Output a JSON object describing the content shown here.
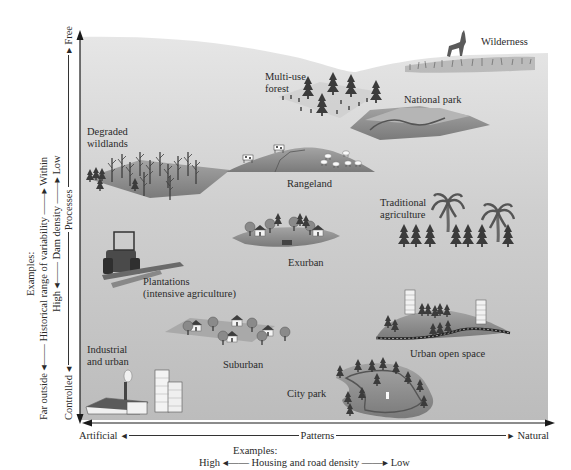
{
  "diagram": {
    "type": "conceptual-scatter",
    "x_axis": {
      "label": "Patterns",
      "left_end": "Artificial",
      "right_end": "Natural",
      "examples_heading": "Examples:",
      "example": {
        "label": "Housing and road density",
        "left": "High",
        "right": "Low"
      }
    },
    "y_axis": {
      "label": "Processes",
      "bottom_end": "Controlled",
      "top_end": "Free",
      "examples_heading": "Examples:",
      "examples": [
        {
          "label": "Historical range of variability",
          "bottom": "Far outside",
          "top": "Within"
        },
        {
          "label": "Dam density",
          "bottom": "High",
          "top": "Low"
        }
      ]
    },
    "landscapes": [
      {
        "id": "wilderness",
        "label": "Wilderness",
        "icon": "deer-grassland-icon"
      },
      {
        "id": "multi-use-forest",
        "label_lines": [
          "Multi-use",
          "forest"
        ],
        "icon": "forest-stumps-icon"
      },
      {
        "id": "national-park",
        "label": "National park",
        "icon": "mountain-river-icon"
      },
      {
        "id": "degraded-wildlands",
        "label_lines": [
          "Degraded",
          "wildlands"
        ],
        "icon": "dead-trees-icon"
      },
      {
        "id": "rangeland",
        "label": "Rangeland",
        "icon": "cattle-sheep-hill-icon"
      },
      {
        "id": "traditional-agriculture",
        "label_lines": [
          "Traditional",
          "agriculture"
        ],
        "icon": "palm-trees-icon"
      },
      {
        "id": "exurban",
        "label": "Exurban",
        "icon": "houses-trees-icon"
      },
      {
        "id": "plantations",
        "label_lines": [
          "Plantations",
          "(intensive agriculture)"
        ],
        "icon": "tractor-icon"
      },
      {
        "id": "suburban",
        "label": "Suburban",
        "icon": "suburban-houses-icon"
      },
      {
        "id": "urban-open-space",
        "label": "Urban open space",
        "icon": "towers-hill-road-icon"
      },
      {
        "id": "industrial-urban",
        "label_lines": [
          "Industrial",
          "and urban"
        ],
        "icon": "factory-towers-icon"
      },
      {
        "id": "city-park",
        "label": "City park",
        "icon": "park-path-fountain-icon"
      }
    ]
  },
  "colors": {
    "plane_top": "#e2e2e2",
    "plane_bottom": "#bdbdbd",
    "axis": "#1a1a1a",
    "land": "#8f8f8f",
    "land_dark": "#6c6c6c",
    "tree": "#3a3a3a"
  }
}
